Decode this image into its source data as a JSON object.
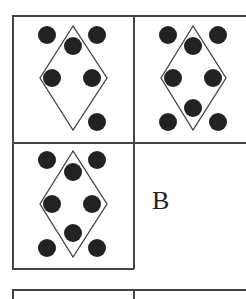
{
  "puzzle": {
    "cells": [
      {
        "id": "cell-1",
        "dots": [
          [
            47,
            35
          ],
          [
            97,
            35
          ],
          [
            73,
            46
          ],
          [
            52,
            78
          ],
          [
            92,
            78
          ],
          [
            97,
            122
          ]
        ]
      },
      {
        "id": "cell-2",
        "dots": [
          [
            168,
            35
          ],
          [
            218,
            35
          ],
          [
            193,
            46
          ],
          [
            173,
            78
          ],
          [
            213,
            78
          ],
          [
            193,
            108
          ],
          [
            168,
            122
          ],
          [
            218,
            122
          ]
        ]
      },
      {
        "id": "cell-3",
        "dots": [
          [
            47,
            160
          ],
          [
            97,
            160
          ],
          [
            73,
            172
          ],
          [
            52,
            204
          ],
          [
            92,
            204
          ],
          [
            73,
            233
          ],
          [
            47,
            248
          ],
          [
            97,
            248
          ]
        ]
      }
    ],
    "answer_label": "B"
  },
  "colors": {
    "line": "#444444",
    "dot": "#222222"
  }
}
